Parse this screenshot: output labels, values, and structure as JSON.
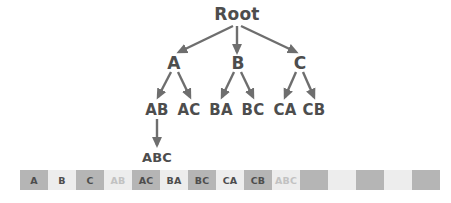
{
  "diagram": {
    "title_node": "Root",
    "type": "tree",
    "colors": {
      "node_text": "#4d4d4d",
      "arrow": "#6e6e6e",
      "cell_dark": "#b5b5b5",
      "cell_light": "#ededed",
      "cell_text_dark": "#4d4d4d",
      "cell_text_muted": "#c2c2c2"
    },
    "levels": [
      {
        "name": "root",
        "nodes": [
          {
            "label": "Root",
            "x": 237,
            "y": 14
          }
        ]
      },
      {
        "name": "level-1",
        "nodes": [
          {
            "label": "A",
            "x": 174,
            "y": 63
          },
          {
            "label": "B",
            "x": 238,
            "y": 63
          },
          {
            "label": "C",
            "x": 300,
            "y": 63
          }
        ]
      },
      {
        "name": "level-2",
        "nodes": [
          {
            "label": "AB",
            "x": 157,
            "y": 110
          },
          {
            "label": "AC",
            "x": 189,
            "y": 110
          },
          {
            "label": "BA",
            "x": 221,
            "y": 110
          },
          {
            "label": "BC",
            "x": 253,
            "y": 110
          },
          {
            "label": "CA",
            "x": 285,
            "y": 110
          },
          {
            "label": "CB",
            "x": 314,
            "y": 110
          }
        ]
      },
      {
        "name": "level-3",
        "nodes": [
          {
            "label": "ABC",
            "x": 157,
            "y": 157
          }
        ]
      }
    ],
    "edges": [
      {
        "from": "Root",
        "to": "A"
      },
      {
        "from": "Root",
        "to": "B"
      },
      {
        "from": "Root",
        "to": "C"
      },
      {
        "from": "A",
        "to": "AB"
      },
      {
        "from": "A",
        "to": "AC"
      },
      {
        "from": "B",
        "to": "BA"
      },
      {
        "from": "B",
        "to": "BC"
      },
      {
        "from": "C",
        "to": "CA"
      },
      {
        "from": "C",
        "to": "CB"
      },
      {
        "from": "AB",
        "to": "ABC"
      }
    ]
  },
  "sequence_bar": {
    "cells": [
      {
        "label": "A",
        "shade": "dark",
        "muted": false
      },
      {
        "label": "B",
        "shade": "light",
        "muted": false
      },
      {
        "label": "C",
        "shade": "dark",
        "muted": false
      },
      {
        "label": "AB",
        "shade": "light",
        "muted": true
      },
      {
        "label": "AC",
        "shade": "dark",
        "muted": false
      },
      {
        "label": "BA",
        "shade": "light",
        "muted": false
      },
      {
        "label": "BC",
        "shade": "dark",
        "muted": false
      },
      {
        "label": "CA",
        "shade": "light",
        "muted": false
      },
      {
        "label": "CB",
        "shade": "dark",
        "muted": false
      },
      {
        "label": "ABC",
        "shade": "light",
        "muted": true
      },
      {
        "label": "",
        "shade": "dark",
        "muted": false
      },
      {
        "label": "",
        "shade": "light",
        "muted": false
      },
      {
        "label": "",
        "shade": "dark",
        "muted": false
      },
      {
        "label": "",
        "shade": "light",
        "muted": false
      },
      {
        "label": "",
        "shade": "dark",
        "muted": false
      }
    ]
  }
}
